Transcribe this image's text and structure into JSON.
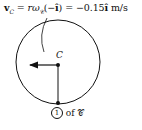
{
  "equation": {
    "lhs": "v",
    "lhs_sub": "C",
    "rhs1": " = rω",
    "rhs1_sub": "𝒞",
    "rhs2": "(−",
    "unit_vec": "î",
    "rhs3": ") = −0.15",
    "unit_vec2": "î",
    "units": " m/s"
  },
  "labels": {
    "center": "C",
    "point_number": "1",
    "point_suffix": " of 𝒞"
  },
  "colors": {
    "stroke": "#111111",
    "background": "#ffffff"
  }
}
